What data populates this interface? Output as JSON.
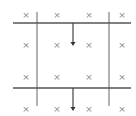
{
  "diagram": {
    "title": "",
    "colors": {
      "line": "#555555",
      "field_mark": "#8a8a8a",
      "background": "#ffffff"
    },
    "field": {
      "symbol": "×",
      "meaning": "magnetic field into page",
      "columns_x": [
        26,
        57,
        89,
        122
      ],
      "rows_y": [
        15,
        45,
        77,
        109
      ]
    },
    "rails": {
      "horizontal": [
        {
          "name": "top-rail",
          "y": 23,
          "x1": 13,
          "x2": 131
        },
        {
          "name": "bottom-rail",
          "y": 88,
          "x1": 13,
          "x2": 131
        }
      ],
      "vertical": [
        {
          "name": "left-rail",
          "x": 37,
          "y1": 12,
          "y2": 106
        },
        {
          "name": "right-rail",
          "x": 109,
          "y1": 12,
          "y2": 106
        }
      ]
    },
    "arrows": [
      {
        "name": "arrow-top",
        "x": 73,
        "y1": 23,
        "y2": 46,
        "direction": "down"
      },
      {
        "name": "arrow-bottom",
        "x": 73,
        "y1": 88,
        "y2": 111,
        "direction": "down"
      }
    ]
  }
}
